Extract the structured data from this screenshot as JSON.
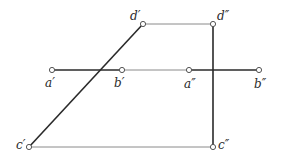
{
  "diagram": {
    "type": "orthographic-projection",
    "colors": {
      "thin_line": "#8a8a8a",
      "thick_line": "#2a2a2a",
      "point": "#555555",
      "background": "#ffffff"
    },
    "points": {
      "a1": {
        "label": "a′",
        "x": 52,
        "y": 70
      },
      "b1": {
        "label": "b′",
        "x": 122,
        "y": 70
      },
      "a2": {
        "label": "a″",
        "x": 189,
        "y": 70
      },
      "b2": {
        "label": "b″",
        "x": 259,
        "y": 70
      },
      "c1": {
        "label": "c′",
        "x": 29,
        "y": 147
      },
      "c2": {
        "label": "c″",
        "x": 213,
        "y": 147
      },
      "d1": {
        "label": "d′",
        "x": 143,
        "y": 24
      },
      "d2": {
        "label": "d″",
        "x": 213,
        "y": 24
      }
    },
    "thick_lines": [
      {
        "name": "line-a1-b1",
        "from": "a1",
        "to": "b1"
      },
      {
        "name": "line-a2-b2",
        "from": "a2",
        "to": "b2"
      },
      {
        "name": "line-c1-d1",
        "from": "c1",
        "to": "d1"
      },
      {
        "name": "line-c2-d2",
        "from": "c2",
        "to": "d2"
      }
    ],
    "thin_lines": [
      {
        "name": "projector-d1-d2",
        "from": "d1",
        "to": "d2"
      },
      {
        "name": "projector-b1-a2",
        "from": "b1",
        "to": "a2"
      },
      {
        "name": "projector-c1-c2",
        "from": "c1",
        "to": "c2"
      }
    ]
  }
}
